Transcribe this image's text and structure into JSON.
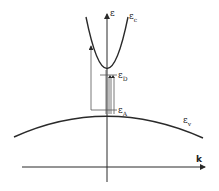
{
  "diagram": {
    "axes": {
      "y_label": "ε",
      "x_label": "k"
    },
    "bands": {
      "conduction": {
        "symbol": "ε",
        "subscript": "c"
      },
      "valence": {
        "symbol": "ε",
        "subscript": "v"
      }
    },
    "levels": {
      "donor": {
        "symbol": "ε",
        "subscript": "D"
      },
      "acceptor": {
        "symbol": "ε",
        "subscript": "A"
      }
    },
    "colors": {
      "line": "#2a2a2a",
      "background": "#ffffff"
    }
  }
}
